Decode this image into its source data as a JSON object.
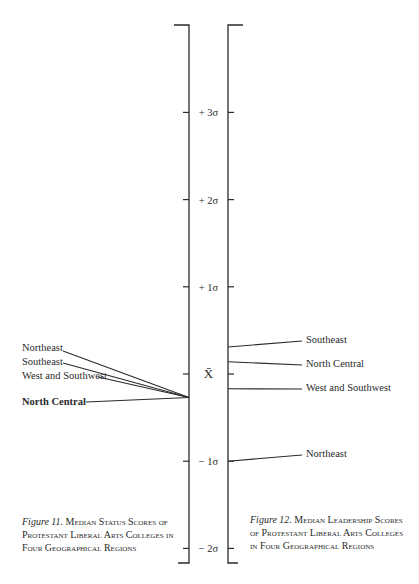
{
  "axis": {
    "ticks": [
      {
        "label": "+ 3σ",
        "value": 3
      },
      {
        "label": "+ 2σ",
        "value": 2
      },
      {
        "label": "+ 1σ",
        "value": 1
      },
      {
        "label": "X̄",
        "value": 0
      },
      {
        "label": "− 1σ",
        "value": -1
      },
      {
        "label": "− 2σ",
        "value": -2
      }
    ]
  },
  "left_figure": {
    "items": [
      {
        "label": "Northeast",
        "bold": false
      },
      {
        "label": "Southeast",
        "bold": false
      },
      {
        "label": "West and Southwest",
        "bold": false
      },
      {
        "label": "North Central",
        "bold": true
      }
    ],
    "pointer_value": -0.27,
    "caption_fig": "Figure 11.",
    "caption_text": "Median Status Scores of Protestant Liberal Arts Colleges in Four Geographical Regions"
  },
  "right_figure": {
    "items": [
      {
        "label": "Southeast",
        "value": 0.31
      },
      {
        "label": "North Central",
        "value": 0.14
      },
      {
        "label": "West and Southwest",
        "value": -0.17
      },
      {
        "label": "Northeast",
        "value": -1.0
      }
    ],
    "caption_fig": "Figure 12.",
    "caption_text": "Median Leadership Scores of Protestant Liberal Arts Colleges in Four Geographical Regions"
  }
}
